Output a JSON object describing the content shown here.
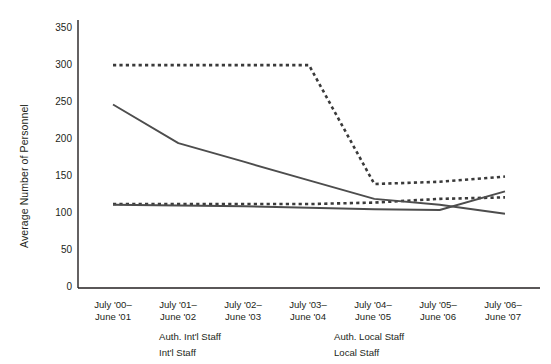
{
  "chart_data": {
    "type": "line",
    "title": "",
    "xlabel": "",
    "ylabel": "Average Number of Personnel",
    "ylim": [
      0,
      350
    ],
    "yticks": [
      0,
      50,
      100,
      150,
      200,
      250,
      300,
      350
    ],
    "ytick_labels": [
      "0",
      "50",
      "100",
      "150",
      "200",
      "250",
      "300",
      "350"
    ],
    "grid": false,
    "legend_position": "bottom",
    "categories": [
      "July '00–\nJune '01",
      "July '01–\nJune '02",
      "July '02–\nJune '03",
      "July '03–\nJune '04",
      "July '04–\nJune '05",
      "July '05–\nJune '06",
      "July '06–\nJune '07"
    ],
    "category_lines": [
      [
        "July '00–",
        "June '01"
      ],
      [
        "July '01–",
        "June '02"
      ],
      [
        "July '02–",
        "June '03"
      ],
      [
        "July '03–",
        "June '04"
      ],
      [
        "July '04–",
        "June '05"
      ],
      [
        "July '05–",
        "June '06"
      ],
      [
        "July '06–",
        "June '07"
      ]
    ],
    "series": [
      {
        "name": "Auth. Int'l Staff",
        "style": "dashed",
        "color": "#3a3a3a",
        "values": [
          300,
          300,
          300,
          300,
          140,
          143,
          150
        ]
      },
      {
        "name": "Auth. Local Staff",
        "style": "dashed",
        "color": "#3a3a3a",
        "values": [
          113,
          113,
          113,
          113,
          115,
          120,
          122
        ]
      },
      {
        "name": "Int'l Staff",
        "style": "solid",
        "color": "#4d4d4d",
        "values": [
          247,
          195,
          170,
          145,
          120,
          112,
          100
        ]
      },
      {
        "name": "Local Staff",
        "style": "solid",
        "color": "#4d4d4d",
        "values": [
          112,
          111,
          110,
          108,
          106,
          105,
          130
        ]
      }
    ]
  },
  "legend": {
    "items": [
      {
        "label": "Auth. Int'l  Staff",
        "style": "dashed"
      },
      {
        "label": "Auth. Local Staff",
        "style": "dashed"
      },
      {
        "label": "Int'l Staff",
        "style": "solid"
      },
      {
        "label": "Local Staff",
        "style": "solid"
      }
    ]
  },
  "colors": {
    "axis": "#231f20",
    "line_solid": "#4d4d4d",
    "line_dashed": "#3a3a3a",
    "background": "#ffffff"
  }
}
